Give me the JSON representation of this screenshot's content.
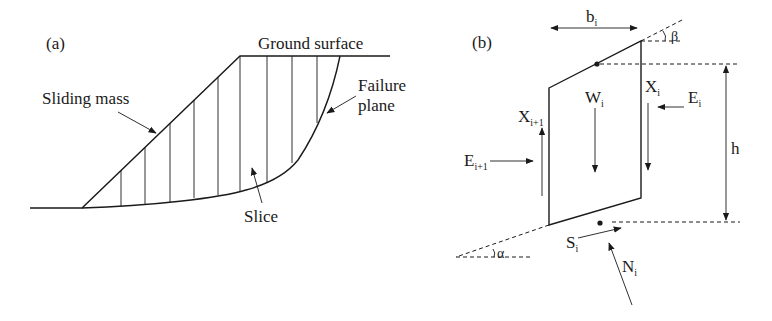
{
  "panel_a": {
    "label": "(a)",
    "ground_surface": "Ground surface",
    "sliding_mass": "Sliding mass",
    "failure_plane_line1": "Failure",
    "failure_plane_line2": "plane",
    "slice": "Slice"
  },
  "panel_b": {
    "label": "(b)",
    "width": {
      "main": "b",
      "sub": "i"
    },
    "beta": "β",
    "alpha": "α",
    "height": "h",
    "weight": {
      "main": "W",
      "sub": "i"
    },
    "shear_right": {
      "main": "X",
      "sub": "i"
    },
    "normal_right": {
      "main": "E",
      "sub": "i"
    },
    "shear_left": {
      "main": "X",
      "sub": "i+1"
    },
    "normal_left": {
      "main": "E",
      "sub": "i+1"
    },
    "base_shear": {
      "main": "S",
      "sub": "i"
    },
    "base_normal": {
      "main": "N",
      "sub": "i"
    }
  }
}
